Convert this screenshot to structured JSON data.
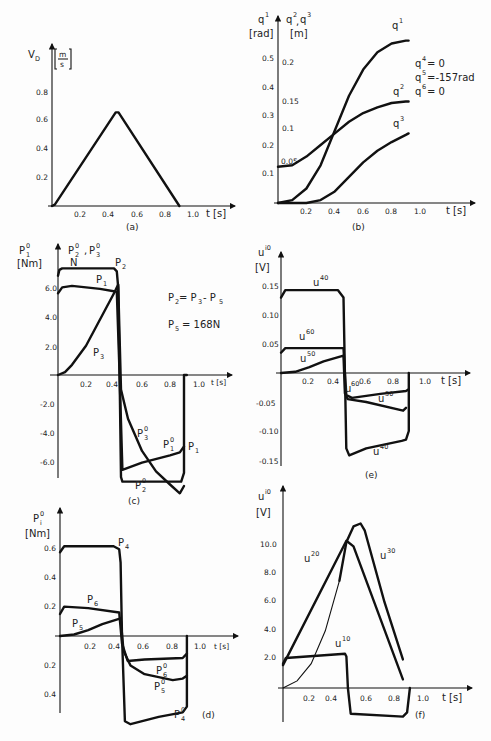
{
  "chart_data": [
    {
      "id": "a",
      "type": "line",
      "caption": "(a)",
      "ylabel": "V_D",
      "yunit": "[m/s]",
      "xlabel": "t [s]",
      "x_ticks": [
        "0.2",
        "0.4",
        "0.6",
        "0.8",
        "1.0"
      ],
      "y_ticks": [
        "0.2",
        "0.4",
        "0.6",
        "0.8"
      ],
      "xlim": [
        0,
        1.1
      ],
      "ylim": [
        0,
        0.95
      ],
      "series": [
        {
          "name": "V_D",
          "x": [
            0,
            0.02,
            0.45,
            0.47,
            0.9
          ],
          "y": [
            0,
            0.01,
            0.65,
            0.65,
            0
          ]
        }
      ]
    },
    {
      "id": "b",
      "type": "line",
      "caption": "(b)",
      "ylabel": "q1 [rad]",
      "ylabel2": "q2, q3 [m]",
      "xlabel": "t [s]",
      "x_ticks": [
        "0.2",
        "0.4",
        "0.6",
        "0.8",
        "1.0"
      ],
      "y_ticks": [
        "0.1",
        "0.2",
        "0.3",
        "0.4",
        "0.5"
      ],
      "y2_ticks": [
        "0.05",
        "0.1",
        "0.15",
        "0.2"
      ],
      "annotations": [
        "q4 = 0",
        "q5 = -1.57 rad",
        "q6 = 0"
      ],
      "series": [
        {
          "name": "q1",
          "x": [
            0,
            0.1,
            0.2,
            0.3,
            0.4,
            0.5,
            0.6,
            0.7,
            0.8,
            0.9,
            0.92
          ],
          "y": [
            0,
            0.01,
            0.05,
            0.13,
            0.25,
            0.37,
            0.46,
            0.52,
            0.55,
            0.56,
            0.56
          ]
        },
        {
          "name": "q2",
          "x": [
            0,
            0.1,
            0.2,
            0.3,
            0.4,
            0.5,
            0.6,
            0.7,
            0.8,
            0.9,
            0.92
          ],
          "y": [
            0.125,
            0.13,
            0.16,
            0.2,
            0.24,
            0.28,
            0.31,
            0.33,
            0.345,
            0.35,
            0.35
          ]
        },
        {
          "name": "q3",
          "x": [
            0,
            0.2,
            0.3,
            0.4,
            0.5,
            0.6,
            0.7,
            0.8,
            0.9,
            0.92
          ],
          "y": [
            0,
            0,
            0.01,
            0.04,
            0.09,
            0.14,
            0.18,
            0.21,
            0.235,
            0.24
          ]
        }
      ]
    },
    {
      "id": "c",
      "type": "line",
      "caption": "(c)",
      "ylabel": "P1^0, P2^0, P3^0 [Nm], N",
      "xlabel": "t [s]",
      "x_ticks": [
        "0.2",
        "0.4",
        "0.6",
        "0.8",
        "1.0"
      ],
      "y_ticks": [
        "-6.0",
        "-4.0",
        "-2.0",
        "2.0",
        "4.0",
        "6.0"
      ],
      "annotations": [
        "P2 = P3 - P5",
        "P5 = 168N"
      ],
      "series": [
        {
          "name": "P2 / P2^0",
          "x": [
            0,
            0.01,
            0.03,
            0.4,
            0.42,
            0.43,
            0.44,
            0.45,
            0.46,
            0.88,
            0.9,
            0.9,
            0.92
          ],
          "y": [
            6.8,
            7.2,
            7.3,
            7.3,
            7.1,
            6.0,
            0,
            -7.0,
            -7.3,
            -7.3,
            -6.7,
            0,
            0
          ]
        },
        {
          "name": "P1 / P1^0",
          "x": [
            0,
            0.03,
            0.1,
            0.2,
            0.3,
            0.42,
            0.44,
            0.46,
            0.6,
            0.8,
            0.87,
            0.9
          ],
          "y": [
            5.6,
            6.0,
            6.1,
            6.0,
            5.9,
            5.7,
            0,
            -6.5,
            -6.0,
            -5.5,
            -5.3,
            -4.9
          ]
        },
        {
          "name": "P3 / P3^0",
          "x": [
            0,
            0.05,
            0.1,
            0.2,
            0.3,
            0.4,
            0.43,
            0.45,
            0.5,
            0.6,
            0.7,
            0.8,
            0.87,
            0.9
          ],
          "y": [
            0,
            0.2,
            0.7,
            2.0,
            3.8,
            5.6,
            6.2,
            -1.0,
            -3.0,
            -5.2,
            -6.6,
            -7.5,
            -8.1,
            -7.6
          ]
        }
      ]
    },
    {
      "id": "d",
      "type": "line",
      "caption": "(d)",
      "ylabel": "Pi^0 [Nm]",
      "xlabel": "t [s]",
      "x_ticks": [
        "0.2",
        "0.4",
        "0.6",
        "0.8",
        "1.0"
      ],
      "y_ticks": [
        "0.4",
        "0.2",
        "0.2",
        "0.4",
        "0.6"
      ],
      "series": [
        {
          "name": "P4 / P4^0",
          "x": [
            0,
            0.03,
            0.1,
            0.38,
            0.42,
            0.43,
            0.44,
            0.46,
            0.5,
            0.7,
            0.87,
            0.9,
            0.9
          ],
          "y": [
            0.57,
            0.61,
            0.61,
            0.61,
            0.59,
            0.5,
            0,
            -0.58,
            -0.6,
            -0.55,
            -0.52,
            -0.48,
            0
          ]
        },
        {
          "name": "P6 / P6^0",
          "x": [
            0,
            0.03,
            0.2,
            0.42,
            0.44,
            0.48,
            0.6,
            0.87,
            0.9
          ],
          "y": [
            0.15,
            0.2,
            0.19,
            0.16,
            -0.05,
            -0.17,
            -0.16,
            -0.15,
            -0.12
          ]
        },
        {
          "name": "P5 / P5^0",
          "x": [
            0,
            0.1,
            0.2,
            0.3,
            0.43,
            0.45,
            0.5,
            0.6,
            0.8,
            0.87,
            0.9
          ],
          "y": [
            0,
            0.01,
            0.04,
            0.08,
            0.12,
            -0.1,
            -0.2,
            -0.26,
            -0.3,
            -0.29,
            -0.27
          ]
        }
      ]
    },
    {
      "id": "e",
      "type": "line",
      "caption": "(e)",
      "ylabel": "u^i0 [V]",
      "xlabel": "t [s]",
      "x_ticks": [
        "0.2",
        "0.4",
        "0.6",
        "0.8",
        "1.0"
      ],
      "y_ticks": [
        "-0.15",
        "-0.10",
        "-0.05",
        "0.05",
        "0.10",
        "0.15"
      ],
      "series": [
        {
          "name": "u40",
          "x": [
            0,
            0.03,
            0.1,
            0.4,
            0.44,
            0.45,
            0.46,
            0.48,
            0.6,
            0.85,
            0.88,
            0.9,
            0.9
          ],
          "y": [
            0.13,
            0.143,
            0.143,
            0.143,
            0.13,
            0,
            -0.13,
            -0.142,
            -0.13,
            -0.117,
            -0.115,
            -0.1,
            0
          ]
        },
        {
          "name": "u60",
          "x": [
            0,
            0.03,
            0.1,
            0.44,
            0.45,
            0.46,
            0.5,
            0.7,
            0.88,
            0.9
          ],
          "y": [
            0.035,
            0.043,
            0.043,
            0.043,
            0,
            -0.038,
            -0.043,
            -0.036,
            -0.031,
            -0.028
          ]
        },
        {
          "name": "u50",
          "x": [
            0,
            0.1,
            0.2,
            0.3,
            0.44,
            0.45,
            0.47,
            0.6,
            0.86,
            0.88
          ],
          "y": [
            0,
            0.002,
            0.01,
            0.02,
            0.03,
            -0.035,
            -0.045,
            -0.05,
            -0.065,
            -0.06
          ]
        }
      ]
    },
    {
      "id": "f",
      "type": "line",
      "caption": "(f)",
      "ylabel": "u^i0 [V]",
      "xlabel": "t [s]",
      "x_ticks": [
        "0.2",
        "0.4",
        "0.6",
        "0.8",
        "1.0"
      ],
      "y_ticks": [
        "2.0",
        "4.0",
        "6.0",
        "8.0",
        "10.0"
      ],
      "series": [
        {
          "name": "u20",
          "x": [
            0,
            0.45,
            0.5,
            0.85
          ],
          "y": [
            1.6,
            10.3,
            9.9,
            0.6
          ]
        },
        {
          "name": "u30",
          "x": [
            0,
            0.1,
            0.2,
            0.3,
            0.4,
            0.45,
            0.5,
            0.55,
            0.58,
            0.72,
            0.85
          ],
          "y": [
            0,
            0.5,
            1.7,
            4.0,
            7.5,
            10.2,
            11.3,
            11.5,
            11.0,
            6.0,
            2.0
          ]
        },
        {
          "name": "u10",
          "x": [
            0,
            0.02,
            0.44,
            0.45,
            0.46,
            0.48,
            0.85,
            0.88,
            0.9
          ],
          "y": [
            1.7,
            2.1,
            2.4,
            2.2,
            0,
            -1.8,
            -2.0,
            -1.7,
            0
          ]
        }
      ]
    }
  ],
  "labels": {
    "a": {
      "y": "V",
      "ysub": "D",
      "unit_num": "m",
      "unit_den": "s",
      "x": "t  [s]",
      "caption": "(a)"
    },
    "b": {
      "q1": "q",
      "sup1": "1",
      "rad": "[rad]",
      "q23": "q",
      "sup2": "2",
      "sep": ",",
      "q3": "q",
      "sup3": "3",
      "m": "[m]",
      "x": "t  [s]",
      "caption": "(b)",
      "q4": "q",
      "q4sup": "4",
      "q4val": "= 0",
      "q5": "q",
      "q5sup": "5",
      "q5val": "=-157rad",
      "q6": "q",
      "q6sup": "6",
      "q6val": "= 0",
      "c1": "q",
      "c1s": "1",
      "c2": "q",
      "c2s": "2",
      "c3": "q",
      "c3s": "3"
    },
    "c": {
      "p1": "P",
      "p1s": "1",
      "p1t": "0",
      "nm": "[Nm]",
      "p23": "P",
      "p2s": "2",
      "p2t": "0",
      "comma": ",",
      "p3": "P",
      "p3s": "3",
      "p3t": "0",
      "n": "N",
      "P2": "P",
      "P2s": "2",
      "P1": "P",
      "P1s": "1",
      "P3": "P",
      "P3s": "3",
      "P30": "P",
      "P30s": "3",
      "P30t": "0",
      "P10": "P",
      "P10s": "1",
      "P10t": "0",
      "P1r": "P",
      "P1rs": "1",
      "P20": "P",
      "P20s": "2",
      "P20t": "0",
      "eq1a": "P",
      "eq1as": "2",
      "eq1b": "= P",
      "eq1bs": "3",
      "eq1c": "- P",
      "eq1cs": "5",
      "eq2a": "P",
      "eq2as": "5",
      "eq2b": "=   168N",
      "x": "t [s]",
      "caption": "(c)"
    },
    "d": {
      "pi": "P",
      "pis": "i",
      "pit": "0",
      "nm": "[Nm]",
      "P4": "P",
      "P4s": "4",
      "P6": "P",
      "P6s": "6",
      "P5": "P",
      "P5s": "5",
      "P60": "P",
      "P60s": "6",
      "P60t": "0",
      "P50": "P",
      "P50s": "5",
      "P50t": "0",
      "P40": "P",
      "P40s": "4",
      "P40t": "0",
      "x": "t [s]",
      "caption": "(d)"
    },
    "e": {
      "u": "u",
      "usup": "i0",
      "v": "[V]",
      "u40": "u",
      "u40s": "40",
      "u60": "u",
      "u60s": "60",
      "u50": "u",
      "u50s": "50",
      "u60b": "u",
      "u60bs": "60",
      "u50b": "u",
      "u50bs": "50",
      "u40b": "u",
      "u40bs": "40",
      "x": "t  [s]",
      "caption": "(e)"
    },
    "f": {
      "u": "u",
      "usup": "i0",
      "v": "[V]",
      "u20": "u",
      "u20s": "20",
      "u30": "u",
      "u30s": "30",
      "u10": "u",
      "u10s": "10",
      "x": "t  [s]",
      "caption": "(f)"
    }
  }
}
